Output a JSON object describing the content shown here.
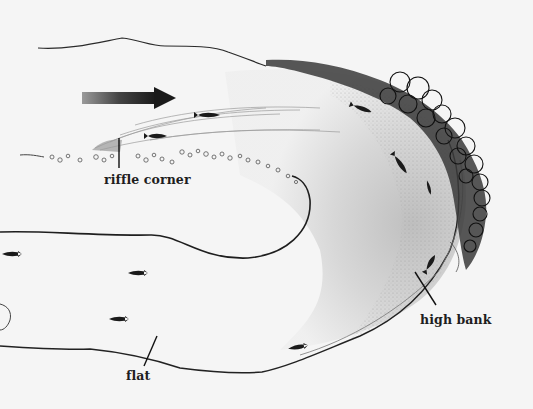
{
  "diagram": {
    "colors": {
      "background": "#f5f5f5",
      "ink": "#1e1e1e",
      "shading": "#8a8a8a",
      "vegetation": "#151515"
    },
    "flow_arrow": {
      "direction": "right",
      "icon": "flow-arrow-icon"
    },
    "labels": [
      {
        "id": "riffle-corner",
        "text": "riffle corner",
        "x": 104,
        "y": 172
      },
      {
        "id": "high-bank",
        "text": "high bank",
        "x": 420,
        "y": 312
      },
      {
        "id": "flat",
        "text": "flat",
        "x": 126,
        "y": 368
      }
    ],
    "fish_count": 9
  }
}
